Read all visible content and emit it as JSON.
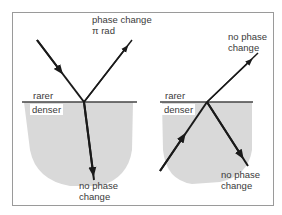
{
  "diagram": {
    "left_panel": {
      "upper_medium": "rarer",
      "lower_medium": "denser",
      "reflected_label_line1": "phase change",
      "reflected_label_line2": "π rad",
      "transmitted_label_line1": "no phase",
      "transmitted_label_line2": "change"
    },
    "right_panel": {
      "upper_medium": "rarer",
      "lower_medium": "denser",
      "transmitted_label_line1": "no phase",
      "transmitted_label_line2": "change",
      "reflected_label_line1": "no phase",
      "reflected_label_line2": "change"
    },
    "colors": {
      "dense_medium_fill": "#d9d9d9",
      "ray": "#1a1a1a",
      "interface": "#444444",
      "frame": "#9a9a9a",
      "text": "#3a3a3a"
    }
  }
}
